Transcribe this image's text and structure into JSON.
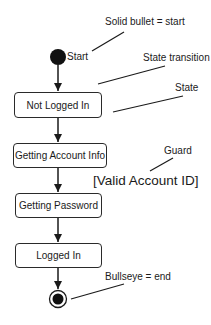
{
  "diagram": {
    "type": "UML state diagram",
    "start": {
      "label": "Start",
      "cx": 58,
      "cy": 57,
      "r": 8
    },
    "states": [
      {
        "label": "Not Logged In",
        "x": 14,
        "y": 92,
        "w": 88,
        "h": 25
      },
      {
        "label": "Getting Account Info",
        "x": 13,
        "y": 143,
        "w": 94,
        "h": 24
      },
      {
        "label": "Getting Password",
        "x": 15,
        "y": 193,
        "w": 87,
        "h": 24
      },
      {
        "label": "Logged In",
        "x": 15,
        "y": 243,
        "w": 87,
        "h": 24
      }
    ],
    "end": {
      "cx": 58,
      "cy": 299,
      "r_outer": 8.5,
      "r_inner": 5.5
    },
    "guard": {
      "text": "[Valid Account ID]"
    },
    "annotations": [
      {
        "id": "start-note",
        "text": "Solid bullet = start"
      },
      {
        "id": "transition-note",
        "text": "State transition"
      },
      {
        "id": "state-note",
        "text": "State"
      },
      {
        "id": "guard-note",
        "text": "Guard"
      },
      {
        "id": "end-note",
        "text": "Bullseye = end"
      }
    ],
    "colors": {
      "stroke": "#1a1a1a",
      "fill": "#111111",
      "background": "#ffffff"
    }
  }
}
